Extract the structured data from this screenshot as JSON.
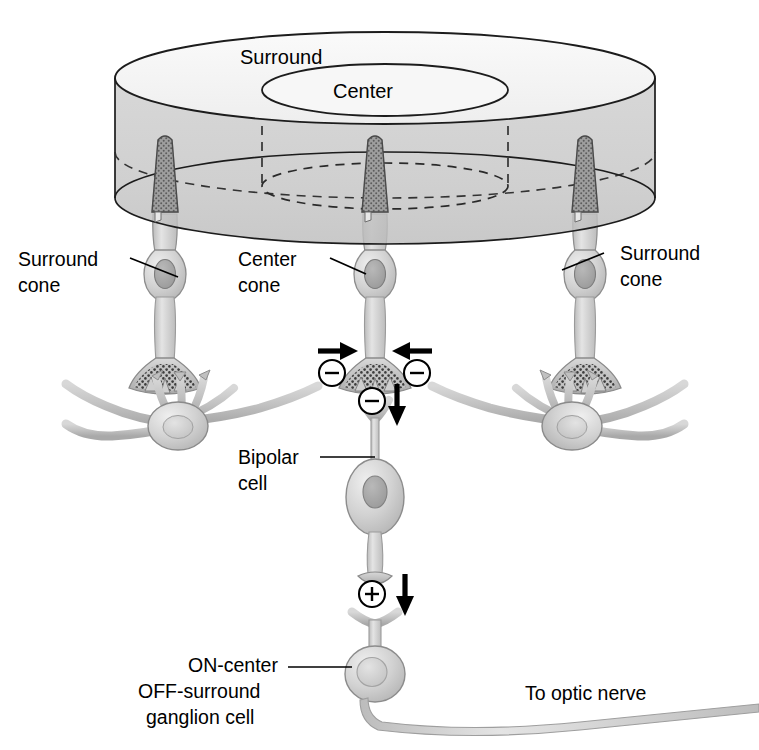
{
  "figure": {
    "background_color": "#ffffff",
    "line_color": "#000000",
    "cell_fill_light": "#d9d9d9",
    "cell_fill_mid": "#bdbdbd",
    "cylinder_top_color": "#f4f4f4",
    "cylinder_body_color": "#c9c9c9",
    "cone_outer_segment_color": "#8f8f8f"
  },
  "labels": {
    "surround_field": "Surround",
    "center_field": "Center",
    "surround_cone_left_line1": "Surround",
    "surround_cone_left_line2": "cone",
    "center_cone_line1": "Center",
    "center_cone_line2": "cone",
    "surround_cone_right_line1": "Surround",
    "surround_cone_right_line2": "cone",
    "bipolar_cell_line1": "Bipolar",
    "bipolar_cell_line2": "cell",
    "ganglion_cell_line1": "ON-center",
    "ganglion_cell_line2": "OFF-surround",
    "ganglion_cell_line3": "ganglion cell",
    "optic_nerve": "To optic nerve"
  },
  "synapse_symbols": [
    {
      "id": "inhibitory-left",
      "sign": "−",
      "x": 332,
      "y": 373,
      "r": 13
    },
    {
      "id": "inhibitory-right",
      "sign": "−",
      "x": 417,
      "y": 373,
      "r": 13
    },
    {
      "id": "inhibitory-bipolar",
      "sign": "−",
      "x": 375,
      "y": 401,
      "r": 13
    },
    {
      "id": "excitatory-ganglion",
      "sign": "+",
      "x": 372,
      "y": 594,
      "r": 13
    }
  ],
  "signal_arrows": [
    {
      "id": "arrow-left-inward",
      "direction": "right",
      "x": 330,
      "y": 351
    },
    {
      "id": "arrow-right-inward",
      "direction": "left",
      "x": 420,
      "y": 351
    },
    {
      "id": "arrow-bipolar-down",
      "direction": "down",
      "x": 396,
      "y": 392
    },
    {
      "id": "arrow-ganglion-down",
      "direction": "down",
      "x": 404,
      "y": 582
    }
  ],
  "cones": [
    {
      "id": "cone-surround-left",
      "role": "Surround",
      "x": 165
    },
    {
      "id": "cone-center",
      "role": "Center",
      "x": 375
    },
    {
      "id": "cone-surround-right",
      "role": "Surround",
      "x": 585
    }
  ],
  "horizontal_cells": [
    {
      "id": "horizontal-cell-left",
      "x": 165
    },
    {
      "id": "horizontal-cell-right",
      "x": 585
    }
  ],
  "cylinder": {
    "center_x": 385,
    "top_ellipse_cy": 78,
    "rx": 270,
    "ry": 46,
    "height": 120,
    "inner_rx": 123,
    "inner_ry": 23
  }
}
